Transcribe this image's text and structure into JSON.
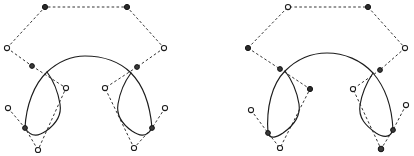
{
  "figure": {
    "width": 414,
    "height": 156,
    "background_color": "#ffffff",
    "curve_color": "#1c1c1c",
    "polygon_color": "#2a2a2a",
    "point_fill_open": "#ffffff",
    "point_fill_solid": "#2b2b2b",
    "panels": [
      {
        "name": "left-spline-diagram",
        "label": "",
        "curves": [
          {
            "name": "left-main-loop",
            "d": "M 25,128 C 26,106 34,84 47,72 C 58,62 70,56 85,56 C 103,56 120,62 131,73 C 143,85 150,104 152,128"
          },
          {
            "name": "left-inner-left-cusp",
            "d": "M 47,72 C 53,80 58,92 60,104 C 62,116 56,124 46,131 C 40,135 32,139 25,128"
          },
          {
            "name": "left-inner-right-cusp",
            "d": "M 131,73 C 125,81 120,92 118,104 C 116,116 122,124 132,131 C 138,135 146,139 152,128"
          }
        ],
        "polygons": [
          {
            "name": "left-upper-control-polygon",
            "d": "M 7,48 L 45,7 L 127,7 L 164,48"
          },
          {
            "name": "left-upper-left-tangent",
            "d": "M 7,48 L 32,66"
          },
          {
            "name": "left-upper-right-tangent",
            "d": "M 164,48 L 137,67"
          },
          {
            "name": "left-inner-left-polygon",
            "d": "M 32,66 L 66,88 L 38,150"
          },
          {
            "name": "left-inner-right-polygon",
            "d": "M 137,67 L 105,88 L 134,148"
          },
          {
            "name": "left-lower-left-polygon",
            "d": "M 8,108 L 25,128 L 38,150"
          },
          {
            "name": "left-lower-right-polygon",
            "d": "M 165,108 L 152,128 L 134,148"
          }
        ],
        "points": [
          {
            "name": "cp-top-left",
            "x": 45,
            "y": 7,
            "style": "filled",
            "r": 2.6
          },
          {
            "name": "cp-top-right",
            "x": 127,
            "y": 7,
            "style": "filled",
            "r": 2.6
          },
          {
            "name": "cp-mid-left",
            "x": 7,
            "y": 48,
            "style": "open",
            "r": 2.6
          },
          {
            "name": "cp-mid-right",
            "x": 164,
            "y": 48,
            "style": "open",
            "r": 2.6
          },
          {
            "name": "knot-upper-left",
            "x": 32,
            "y": 66,
            "style": "knot",
            "r": 2.4
          },
          {
            "name": "knot-upper-right",
            "x": 137,
            "y": 67,
            "style": "knot",
            "r": 2.4
          },
          {
            "name": "cp-inner-left",
            "x": 66,
            "y": 88,
            "style": "open",
            "r": 2.6
          },
          {
            "name": "cp-inner-right",
            "x": 105,
            "y": 88,
            "style": "open",
            "r": 2.6
          },
          {
            "name": "cp-lower-far-left",
            "x": 8,
            "y": 108,
            "style": "open",
            "r": 2.6
          },
          {
            "name": "cp-lower-far-right",
            "x": 165,
            "y": 108,
            "style": "open",
            "r": 2.6
          },
          {
            "name": "knot-lower-left",
            "x": 25,
            "y": 128,
            "style": "knot",
            "r": 2.4
          },
          {
            "name": "knot-lower-right",
            "x": 152,
            "y": 128,
            "style": "knot",
            "r": 2.4
          },
          {
            "name": "cp-bottom-left",
            "x": 38,
            "y": 150,
            "style": "open",
            "r": 2.6
          },
          {
            "name": "cp-bottom-right",
            "x": 134,
            "y": 148,
            "style": "open",
            "r": 2.6
          }
        ]
      },
      {
        "name": "right-spline-diagram",
        "label": "",
        "curves": [
          {
            "name": "right-main-loop",
            "d": "M 268,133 C 266,108 272,84 285,71 C 297,59 311,53 327,53 C 344,53 361,60 373,73 C 385,87 392,106 393,130"
          },
          {
            "name": "right-inner-left-cusp",
            "d": "M 285,71 C 292,80 297,92 299,104 C 301,117 293,126 283,133 C 277,137 270,140 268,133"
          },
          {
            "name": "right-inner-right-cusp",
            "d": "M 373,73 C 367,82 362,93 360,105 C 358,118 366,126 376,133 C 382,137 390,139 393,130"
          }
        ],
        "polygons": [
          {
            "name": "right-upper-control-polygon",
            "d": "M 248,48 L 288,7 L 368,7 L 405,48"
          },
          {
            "name": "right-upper-left-tangent",
            "d": "M 248,48 L 280,69"
          },
          {
            "name": "right-upper-right-tangent",
            "d": "M 405,48 L 380,70"
          },
          {
            "name": "right-inner-left-polygon",
            "d": "M 280,69 L 310,89 L 280,148"
          },
          {
            "name": "right-inner-right-polygon",
            "d": "M 380,70 L 353,89 L 381,149"
          },
          {
            "name": "right-lower-left-polygon",
            "d": "M 251,110 L 268,133 L 280,148"
          },
          {
            "name": "right-lower-right-polygon",
            "d": "M 406,105 L 393,130 L 381,149"
          }
        ],
        "points": [
          {
            "name": "cp-top-left",
            "x": 288,
            "y": 7,
            "style": "open",
            "r": 2.6
          },
          {
            "name": "cp-top-right",
            "x": 368,
            "y": 7,
            "style": "filled",
            "r": 2.6
          },
          {
            "name": "cp-mid-left",
            "x": 248,
            "y": 48,
            "style": "filled",
            "r": 2.6
          },
          {
            "name": "cp-mid-right",
            "x": 405,
            "y": 48,
            "style": "open",
            "r": 2.6
          },
          {
            "name": "knot-upper-left",
            "x": 280,
            "y": 69,
            "style": "knot",
            "r": 2.4
          },
          {
            "name": "knot-upper-right",
            "x": 380,
            "y": 70,
            "style": "knot",
            "r": 2.4
          },
          {
            "name": "cp-inner-left",
            "x": 310,
            "y": 89,
            "style": "filled",
            "r": 2.6
          },
          {
            "name": "cp-inner-right",
            "x": 353,
            "y": 89,
            "style": "open",
            "r": 2.6
          },
          {
            "name": "cp-lower-far-left",
            "x": 251,
            "y": 110,
            "style": "open",
            "r": 2.6
          },
          {
            "name": "cp-lower-far-right",
            "x": 406,
            "y": 105,
            "style": "open",
            "r": 2.6
          },
          {
            "name": "knot-lower-left",
            "x": 268,
            "y": 133,
            "style": "knot",
            "r": 2.4
          },
          {
            "name": "knot-lower-right",
            "x": 393,
            "y": 130,
            "style": "knot",
            "r": 2.4
          },
          {
            "name": "cp-bottom-left",
            "x": 280,
            "y": 148,
            "style": "open",
            "r": 2.6
          },
          {
            "name": "cp-bottom-right",
            "x": 381,
            "y": 149,
            "style": "knot",
            "r": 2.8
          }
        ]
      }
    ]
  }
}
